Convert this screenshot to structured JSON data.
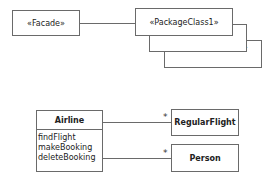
{
  "facade_diagram": {
    "facade": {
      "label": "«Facade»"
    },
    "package_classes": [
      {
        "label": "«PackageClass1»"
      },
      {
        "label": "«PackageClass2»"
      },
      {
        "label": "«PackageClass3»"
      }
    ]
  },
  "class_diagram": {
    "airline": {
      "name": "Airline",
      "operations": [
        "findFlight",
        "makeBooking",
        "deleteBooking"
      ]
    },
    "associations": [
      {
        "target": "RegularFlight",
        "multiplicity": "*"
      },
      {
        "target": "Person",
        "multiplicity": "*"
      }
    ]
  }
}
